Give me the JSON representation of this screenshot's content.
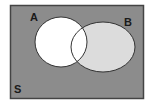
{
  "diagram": {
    "type": "venn",
    "universe": {
      "label": "S",
      "fill": "#8c8c8c",
      "border": "#444444"
    },
    "sets": [
      {
        "label": "A",
        "fill": "#ffffff",
        "stroke": "#333333"
      },
      {
        "label": "B",
        "fill": "#dcdcdc",
        "stroke": "#333333"
      }
    ],
    "shaded_region": "B minus A",
    "intersection_fill": "#ffffff"
  }
}
